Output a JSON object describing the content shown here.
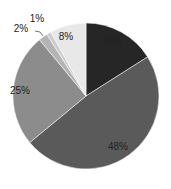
{
  "chart_data": {
    "type": "pie",
    "title": "",
    "categories": [
      "Slice A",
      "Slice B",
      "Slice C",
      "Slice D",
      "Slice E",
      "Slice F"
    ],
    "values": [
      16,
      48,
      25,
      2,
      1,
      8
    ],
    "labels": [
      "16%",
      "48%",
      "25%",
      "2%",
      "1%",
      "8%"
    ],
    "colors": [
      "#262626",
      "#5a5a5a",
      "#8c8c8c",
      "#b4b4b4",
      "#cdcdcd",
      "#e8e8e8"
    ],
    "start_angle": "12 o'clock",
    "direction": "clockwise",
    "legend": "none",
    "data_labels": "percent"
  },
  "geometry": {
    "cx": 86,
    "cy": 96,
    "r": 73
  }
}
